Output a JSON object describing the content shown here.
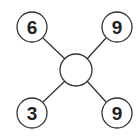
{
  "diagram": {
    "center": {
      "value": ""
    },
    "nodes": [
      {
        "position": "top-left",
        "value": "6"
      },
      {
        "position": "top-right",
        "value": "9"
      },
      {
        "position": "bottom-left",
        "value": "3"
      },
      {
        "position": "bottom-right",
        "value": "9"
      }
    ],
    "colors": {
      "stroke": "#333333",
      "text": "#222222",
      "fill": "#ffffff"
    }
  }
}
